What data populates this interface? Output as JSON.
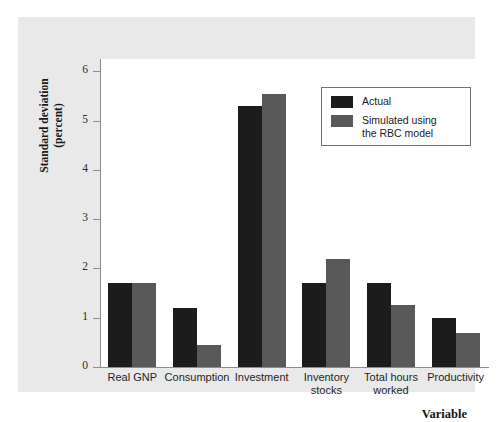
{
  "chart_data": {
    "type": "bar",
    "title": "",
    "xlabel": "Variable",
    "ylabel": "Standard deviation\n(percent)",
    "categories": [
      "Real GNP",
      "Consumption",
      "Investment",
      "Inventory\nstocks",
      "Total hours\nworked",
      "Productivity"
    ],
    "series": [
      {
        "name": "Actual",
        "color": "#1c1c1c",
        "values": [
          1.7,
          1.2,
          5.3,
          1.7,
          1.7,
          1.0
        ]
      },
      {
        "name": "Simulated using\nthe RBC model",
        "color": "#595959",
        "values": [
          1.7,
          0.45,
          5.55,
          2.2,
          1.25,
          0.7
        ]
      }
    ],
    "ylim": [
      0,
      6.25
    ],
    "yticks": [
      0,
      1,
      2,
      3,
      4,
      5,
      6
    ],
    "ytick_labels": [
      "0",
      "1",
      "2",
      "3",
      "4",
      "5",
      "6"
    ],
    "grid": false,
    "legend_position": "top-right"
  },
  "colors": {
    "actual": "#1c1c1c",
    "simulated": "#595959",
    "panel_background": "#e9e9e9",
    "plot_background": "#ffffff",
    "axis": "#8d8d8d"
  }
}
